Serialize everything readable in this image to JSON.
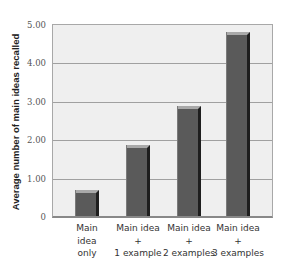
{
  "chart_data": {
    "type": "bar",
    "title": "",
    "xlabel": "",
    "ylabel": "Average number of main ideas recalled",
    "categories": [
      [
        "Main",
        "idea",
        "only"
      ],
      [
        "Main idea",
        "+",
        "1 example"
      ],
      [
        "Main idea",
        "+",
        "2 examples"
      ],
      [
        "Main idea",
        "+",
        "3 examples"
      ]
    ],
    "category_labels": [
      "Main idea only",
      "Main idea + 1 example",
      "Main idea + 2 examples",
      "Main idea + 3 examples"
    ],
    "values": [
      0.68,
      1.84,
      2.86,
      4.78
    ],
    "ylim": [
      0,
      5
    ],
    "yticks": [
      "0",
      "1.00",
      "2.00",
      "3.00",
      "4.00",
      "5.00"
    ],
    "grid": true,
    "legend": null,
    "bar_color": "#5a5a5a"
  }
}
